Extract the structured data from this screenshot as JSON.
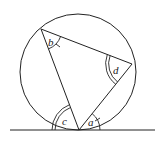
{
  "diagram": {
    "colors": {
      "stroke": "#222222",
      "background": "#ffffff"
    },
    "circle": {
      "cx": 78,
      "cy": 72,
      "r": 58
    },
    "tangent_line": {
      "x1": 10,
      "y1": 130,
      "x2": 155,
      "y2": 130
    },
    "vertices": {
      "top_left": {
        "x": 41,
        "y": 29
      },
      "right": {
        "x": 132,
        "y": 64
      },
      "bottom": {
        "x": 79,
        "y": 130
      }
    },
    "angle_labels": {
      "a": "a",
      "b": "b",
      "c": "c",
      "d": "d"
    }
  }
}
